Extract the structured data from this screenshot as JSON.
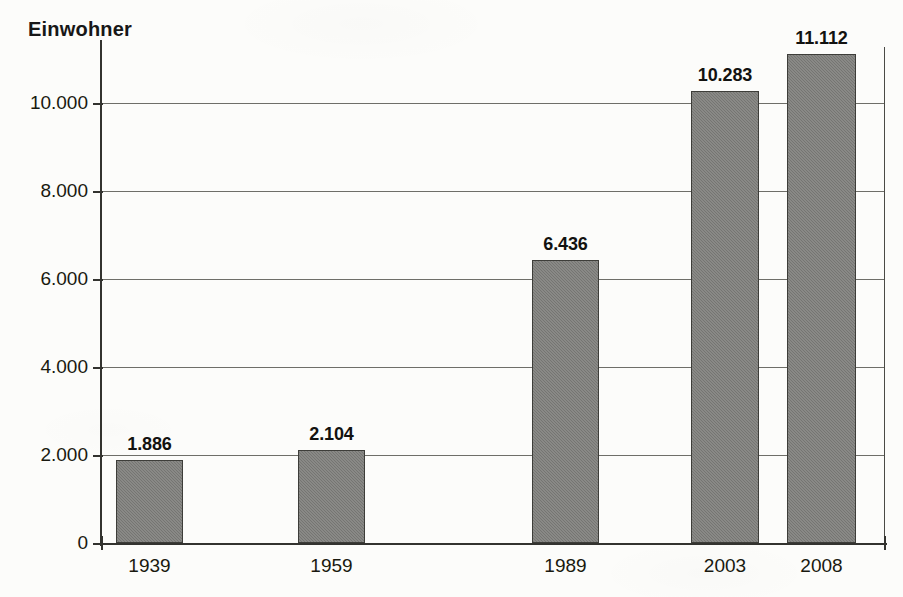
{
  "chart_data": {
    "type": "bar",
    "title": "Einwohner",
    "xlabel": "",
    "ylabel": "Einwohner",
    "categories": [
      "1939",
      "1959",
      "1989",
      "2003",
      "2008"
    ],
    "values": [
      1886,
      2104,
      6436,
      10283,
      11112
    ],
    "value_labels": [
      "1.886",
      "2.104",
      "6.436",
      "10.283",
      "11.112"
    ],
    "ylim": [
      0,
      11272
    ],
    "ytick_values": [
      0,
      2000,
      4000,
      6000,
      8000,
      10000
    ],
    "ytick_labels": [
      "0",
      "2.000",
      "4.000",
      "6.000",
      "8.000",
      "10.000"
    ],
    "grid": "horizontal",
    "legend": "none",
    "bar_color": "#7b7b78",
    "bar_border_color": "#3d3d39",
    "text_color": "#19190f",
    "background": "#fcfcfa",
    "bars": [
      {
        "category": "1939",
        "value": 1886,
        "label": "1.886",
        "x": 116,
        "width": 67
      },
      {
        "category": "1959",
        "value": 2104,
        "label": "2.104",
        "x": 298,
        "width": 67
      },
      {
        "category": "1989",
        "value": 6436,
        "label": "6.436",
        "x": 532,
        "width": 67
      },
      {
        "category": "2003",
        "value": 10283,
        "label": "10.283",
        "x": 691,
        "width": 68
      },
      {
        "category": "2008",
        "value": 11112,
        "label": "11.112",
        "x": 787,
        "width": 69
      }
    ]
  }
}
